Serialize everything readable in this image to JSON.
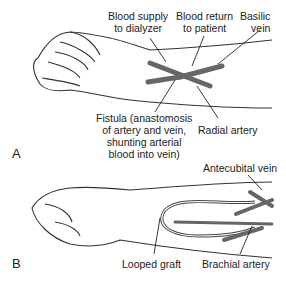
{
  "panel_a": {
    "letter": "A",
    "labels": {
      "blood_supply_1": "Blood supply",
      "blood_supply_2": "to dialyzer",
      "blood_return_1": "Blood return",
      "blood_return_2": "to patient",
      "basilic_1": "Basilic",
      "basilic_2": "vein",
      "fistula_1": "Fistula (anastomosis",
      "fistula_2": "of artery and vein,",
      "fistula_3": "shunting arterial",
      "fistula_4": "blood into vein)",
      "radial": "Radial artery"
    }
  },
  "panel_b": {
    "letter": "B",
    "labels": {
      "antecubital": "Antecubital vein",
      "looped_graft": "Looped graft",
      "brachial": "Brachial artery"
    }
  },
  "colors": {
    "vessel": "#666666",
    "outline": "#333333"
  }
}
